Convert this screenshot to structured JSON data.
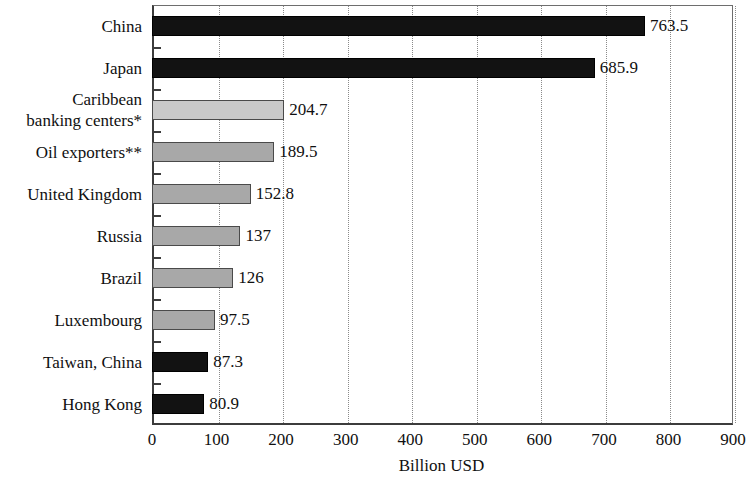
{
  "chart_data": {
    "type": "bar",
    "orientation": "horizontal",
    "title": "",
    "xlabel": "Billion USD",
    "ylabel": "",
    "xlim": [
      0,
      900
    ],
    "xticks": [
      0,
      100,
      200,
      300,
      400,
      500,
      600,
      700,
      800,
      900
    ],
    "xtick_labels": [
      "0",
      "100",
      "200",
      "300",
      "400",
      "500",
      "600",
      "700",
      "800",
      "900"
    ],
    "grid": "vertical-dotted",
    "legend": "none",
    "categories": [
      "China",
      "Japan",
      "Caribbean banking centers*",
      "Oil exporters**",
      "United Kingdom",
      "Russia",
      "Brazil",
      "Luxembourg",
      "Taiwan, China",
      "Hong Kong"
    ],
    "values": [
      763.5,
      685.9,
      204.7,
      189.5,
      152.8,
      137,
      126,
      97.5,
      87.3,
      80.9
    ],
    "value_labels": [
      "763.5",
      "685.9",
      "204.7",
      "189.5",
      "152.8",
      "137",
      "126",
      "97.5",
      "87.3",
      "80.9"
    ],
    "bar_styles": [
      "dark",
      "dark",
      "light",
      "mid",
      "mid",
      "mid",
      "mid",
      "mid",
      "dark",
      "dark"
    ],
    "colors": {
      "dark": "#121212",
      "mid": "#a8a8a8",
      "light": "#c9c9c9",
      "axis": "#3c3c3c",
      "grid": "#8a8a8a",
      "text": "#101010",
      "background": "#ffffff"
    }
  },
  "categories_display": [
    [
      "China"
    ],
    [
      "Japan"
    ],
    [
      "Caribbean",
      "banking centers*"
    ],
    [
      "Oil exporters**"
    ],
    [
      "United Kingdom"
    ],
    [
      "Russia"
    ],
    [
      "Brazil"
    ],
    [
      "Luxembourg"
    ],
    [
      "Taiwan, China"
    ],
    [
      "Hong Kong"
    ]
  ]
}
